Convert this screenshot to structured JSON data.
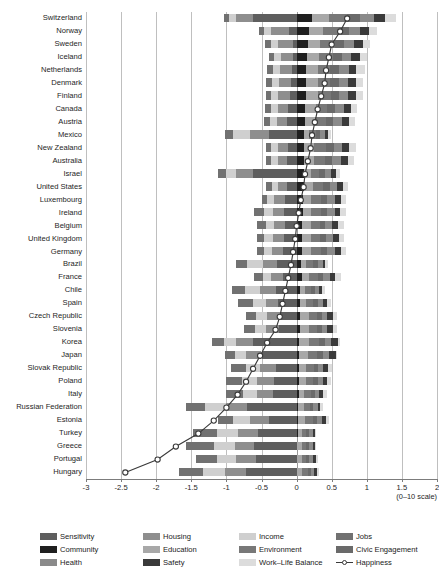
{
  "chart_data": {
    "type": "bar",
    "subtype": "stacked-diverging-horizontal-with-line-overlay",
    "title": "",
    "xlabel": "(0–10 scale)",
    "ylabel": "",
    "xlim": [
      -3,
      2
    ],
    "xticks": [
      -3,
      -2.5,
      -2,
      -1.5,
      -1,
      -0.5,
      0,
      0.5,
      1,
      1.5,
      2
    ],
    "xtick_labels": [
      "-3",
      "-2.5",
      "-2",
      "-1.5",
      "-1",
      "-0.5",
      "0",
      "0.5",
      "1",
      "1.5",
      "2"
    ],
    "grid": true,
    "grid_axis": "x",
    "legend_position": "bottom",
    "categories": [
      "Switzerland",
      "Norway",
      "Sweden",
      "Iceland",
      "Netherlands",
      "Denmark",
      "Finland",
      "Canada",
      "Austria",
      "Mexico",
      "New Zealand",
      "Australia",
      "Israel",
      "United States",
      "Luxembourg",
      "Ireland",
      "Belgium",
      "United Kingdom",
      "Germany",
      "Brazil",
      "France",
      "Chile",
      "Spain",
      "Czech Republic",
      "Slovenia",
      "Korea",
      "Japan",
      "Slovak Republic",
      "Poland",
      "Italy",
      "Russian Federation",
      "Estonia",
      "Turkey",
      "Greece",
      "Portugal",
      "Hungary"
    ],
    "series": [
      {
        "name": "Sensitivity",
        "color": "#5e5e5e",
        "values": [
          -0.62,
          -0.11,
          -0.05,
          -0.05,
          -0.06,
          -0.08,
          -0.1,
          -0.12,
          -0.14,
          -0.4,
          -0.12,
          -0.13,
          -0.62,
          -0.14,
          -0.16,
          -0.18,
          -0.17,
          -0.18,
          -0.19,
          -0.28,
          -0.2,
          -0.3,
          -0.26,
          -0.24,
          -0.25,
          -0.62,
          -0.5,
          -0.3,
          -0.32,
          -0.33,
          -0.7,
          -0.4,
          -0.55,
          -0.6,
          -0.58,
          -0.72
        ]
      },
      {
        "name": "Housing",
        "color": "#8e8e8e",
        "values": [
          -0.24,
          -0.25,
          -0.22,
          -0.17,
          -0.18,
          -0.17,
          -0.16,
          -0.15,
          -0.14,
          -0.26,
          -0.14,
          -0.13,
          -0.24,
          -0.13,
          -0.16,
          -0.16,
          -0.15,
          -0.16,
          -0.16,
          -0.2,
          -0.16,
          -0.22,
          -0.18,
          -0.18,
          -0.18,
          -0.24,
          -0.22,
          -0.22,
          -0.24,
          -0.24,
          -0.3,
          -0.26,
          -0.28,
          -0.28,
          -0.28,
          -0.3
        ]
      },
      {
        "name": "Income",
        "color": "#cfcfcf",
        "values": [
          -0.1,
          -0.1,
          -0.1,
          -0.1,
          -0.1,
          -0.1,
          -0.1,
          -0.1,
          -0.1,
          -0.24,
          -0.1,
          -0.1,
          -0.14,
          -0.08,
          -0.1,
          -0.12,
          -0.12,
          -0.12,
          -0.12,
          -0.22,
          -0.12,
          -0.22,
          -0.18,
          -0.16,
          -0.16,
          -0.18,
          -0.16,
          -0.2,
          -0.22,
          -0.2,
          -0.3,
          -0.24,
          -0.3,
          -0.3,
          -0.28,
          -0.32
        ]
      },
      {
        "name": "Jobs",
        "color": "#717171",
        "values": [
          -0.08,
          -0.08,
          -0.08,
          -0.08,
          -0.08,
          -0.08,
          -0.08,
          -0.08,
          -0.08,
          -0.12,
          -0.08,
          -0.08,
          -0.12,
          -0.08,
          -0.08,
          -0.14,
          -0.12,
          -0.1,
          -0.1,
          -0.16,
          -0.12,
          -0.18,
          -0.22,
          -0.14,
          -0.16,
          -0.16,
          -0.14,
          -0.22,
          -0.22,
          -0.24,
          -0.28,
          -0.22,
          -0.34,
          -0.4,
          -0.3,
          -0.34
        ]
      },
      {
        "name": "Community",
        "color": "#1f1f1f",
        "values": [
          0.22,
          0.18,
          0.16,
          0.15,
          0.14,
          0.14,
          0.13,
          0.12,
          0.12,
          0.1,
          0.11,
          0.11,
          0.1,
          0.1,
          0.09,
          0.09,
          0.08,
          0.08,
          0.08,
          0.06,
          0.07,
          0.05,
          0.05,
          0.05,
          0.05,
          0.04,
          0.04,
          0.04,
          0.03,
          0.03,
          0.02,
          0.02,
          0.02,
          0.01,
          0.01,
          0.01
        ]
      },
      {
        "name": "Education",
        "color": "#a8a8a8",
        "values": [
          0.24,
          0.2,
          0.18,
          0.17,
          0.16,
          0.16,
          0.18,
          0.15,
          0.14,
          0.08,
          0.14,
          0.14,
          0.1,
          0.14,
          0.12,
          0.12,
          0.12,
          0.12,
          0.13,
          0.08,
          0.11,
          0.07,
          0.09,
          0.12,
          0.12,
          0.14,
          0.12,
          0.1,
          0.1,
          0.08,
          0.08,
          0.1,
          0.05,
          0.06,
          0.06,
          0.07
        ]
      },
      {
        "name": "Environment",
        "color": "#787878",
        "values": [
          0.26,
          0.22,
          0.2,
          0.2,
          0.18,
          0.18,
          0.18,
          0.17,
          0.16,
          0.1,
          0.17,
          0.16,
          0.12,
          0.14,
          0.14,
          0.14,
          0.13,
          0.13,
          0.14,
          0.1,
          0.12,
          0.09,
          0.1,
          0.12,
          0.12,
          0.14,
          0.13,
          0.11,
          0.11,
          0.1,
          0.09,
          0.11,
          0.07,
          0.07,
          0.07,
          0.08
        ]
      },
      {
        "name": "Civic Engagement",
        "color": "#6a6a6a",
        "values": [
          0.18,
          0.14,
          0.13,
          0.12,
          0.12,
          0.12,
          0.11,
          0.11,
          0.1,
          0.06,
          0.11,
          0.1,
          0.08,
          0.09,
          0.09,
          0.09,
          0.08,
          0.09,
          0.09,
          0.06,
          0.08,
          0.05,
          0.06,
          0.07,
          0.07,
          0.08,
          0.08,
          0.06,
          0.06,
          0.05,
          0.05,
          0.06,
          0.04,
          0.04,
          0.04,
          0.04
        ]
      },
      {
        "name": "Health",
        "color": "#8a8a8a",
        "values": [
          0.2,
          0.16,
          0.15,
          0.14,
          0.14,
          0.13,
          0.13,
          0.12,
          0.12,
          0.07,
          0.12,
          0.12,
          0.09,
          0.11,
          0.1,
          0.1,
          0.1,
          0.1,
          0.1,
          0.07,
          0.09,
          0.06,
          0.07,
          0.08,
          0.08,
          0.09,
          0.09,
          0.07,
          0.07,
          0.06,
          0.06,
          0.07,
          0.05,
          0.05,
          0.05,
          0.05
        ]
      },
      {
        "name": "Safety",
        "color": "#3a3a3a",
        "values": [
          0.16,
          0.13,
          0.12,
          0.12,
          0.11,
          0.11,
          0.11,
          0.1,
          0.1,
          0.04,
          0.1,
          0.1,
          0.07,
          0.08,
          0.09,
          0.08,
          0.08,
          0.08,
          0.09,
          0.04,
          0.08,
          0.04,
          0.06,
          0.08,
          0.08,
          0.1,
          0.1,
          0.07,
          0.07,
          0.06,
          0.04,
          0.06,
          0.03,
          0.03,
          0.04,
          0.04
        ]
      },
      {
        "name": "Work–Life Balance",
        "color": "#dcdcdc",
        "values": [
          0.16,
          0.12,
          0.1,
          0.1,
          0.12,
          0.11,
          0.1,
          0.09,
          0.09,
          0.04,
          0.09,
          0.09,
          0.06,
          0.07,
          0.08,
          0.08,
          0.09,
          0.07,
          0.08,
          0.04,
          0.08,
          0.04,
          0.06,
          0.06,
          0.06,
          0.03,
          0.02,
          0.05,
          0.05,
          0.05,
          0.04,
          0.04,
          0.02,
          0.02,
          0.03,
          0.03
        ]
      }
    ],
    "overlay": {
      "name": "Happiness",
      "type": "line",
      "color": "#3a3a3a",
      "marker": "open-circle",
      "values": [
        0.72,
        0.62,
        0.5,
        0.46,
        0.42,
        0.4,
        0.35,
        0.3,
        0.26,
        0.22,
        0.2,
        0.16,
        0.12,
        0.1,
        0.06,
        0.03,
        0.0,
        -0.02,
        -0.05,
        -0.08,
        -0.12,
        -0.16,
        -0.2,
        -0.24,
        -0.3,
        -0.42,
        -0.52,
        -0.62,
        -0.72,
        -0.84,
        -1.0,
        -1.18,
        -1.4,
        -1.72,
        -1.98,
        -2.44
      ]
    }
  },
  "legend": {
    "rows": [
      [
        {
          "label": "Sensitivity",
          "color": "#5e5e5e",
          "kind": "swatch"
        },
        {
          "label": "Housing",
          "color": "#8e8e8e",
          "kind": "swatch"
        },
        {
          "label": "Income",
          "color": "#cfcfcf",
          "kind": "swatch"
        },
        {
          "label": "Jobs",
          "color": "#717171",
          "kind": "swatch"
        }
      ],
      [
        {
          "label": "Community",
          "color": "#1f1f1f",
          "kind": "swatch"
        },
        {
          "label": "Education",
          "color": "#a8a8a8",
          "kind": "swatch"
        },
        {
          "label": "Environment",
          "color": "#787878",
          "kind": "swatch"
        },
        {
          "label": "Civic Engagement",
          "color": "#6a6a6a",
          "kind": "swatch"
        }
      ],
      [
        {
          "label": "Health",
          "color": "#8a8a8a",
          "kind": "swatch"
        },
        {
          "label": "Safety",
          "color": "#3a3a3a",
          "kind": "swatch"
        },
        {
          "label": "Work–Life Balance",
          "color": "#dcdcdc",
          "kind": "swatch"
        },
        {
          "label": "Happiness",
          "color": "#3a3a3a",
          "kind": "line"
        }
      ]
    ]
  },
  "axis": {
    "scale_note": "(0–10 scale)"
  }
}
